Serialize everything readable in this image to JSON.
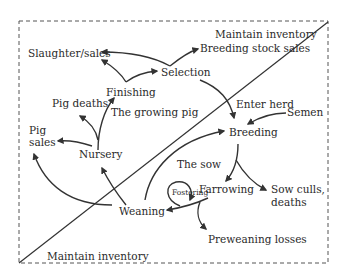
{
  "colors": {
    "stroke": "#333333",
    "text": "#2a2a2a",
    "background": "#ffffff"
  },
  "labels": {
    "maintain_top": "Maintain inventory",
    "maintain_bottom": "Maintain inventory",
    "slaughter_sales": "Slaughter/sales",
    "breeding_stock_sales": "Breeding stock sales",
    "selection": "Selection",
    "finishing": "Finishing",
    "pig_deaths": "Pig deaths",
    "growing_pig": "The growing pig",
    "enter_herd": "Enter herd",
    "semen": "Semen",
    "breeding": "Breeding",
    "pig_sales_line1": "Pig",
    "pig_sales_line2": "sales",
    "nursery": "Nursery",
    "the_sow": "The sow",
    "farrowing": "Farrowing",
    "fostering": "Fostering",
    "sow_culls_line1": "Sow culls,",
    "sow_culls_line2": "deaths",
    "weaning": "Weaning",
    "preweaning_losses": "Preweaning losses"
  }
}
